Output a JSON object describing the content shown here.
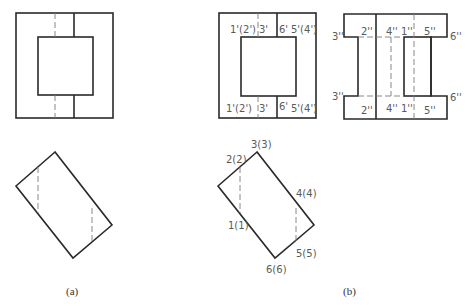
{
  "figure": {
    "panel_a": {
      "caption": "(a)"
    },
    "panel_b": {
      "caption": "(b)",
      "front_view_labels": {
        "top_left": "1'(2')",
        "top_mid": "3'",
        "top_right_1": "6'",
        "top_right_2": "5'(4')",
        "bottom_left": "1'(2')",
        "bottom_mid": "3'",
        "bottom_right_1": "6'",
        "bottom_right_2": "5'(4')"
      },
      "side_view_labels": {
        "top_3": "3''",
        "top_2": "2''",
        "top_4": "4''",
        "top_1": "1''",
        "top_5": "5''",
        "top_6": "6''",
        "bottom_3": "3''",
        "bottom_2": "2''",
        "bottom_4": "4''",
        "bottom_1": "1''",
        "bottom_5": "5''",
        "bottom_6": "6''"
      },
      "top_view_labels": {
        "p3": "3(3)",
        "p2": "2(2)",
        "p4": "4(4)",
        "p1": "1(1)",
        "p5": "5(5)",
        "p6": "6(6)"
      }
    }
  }
}
